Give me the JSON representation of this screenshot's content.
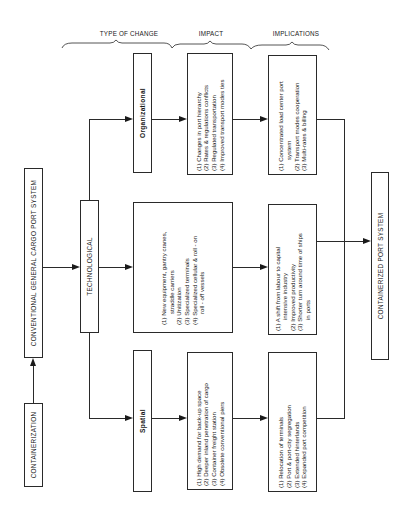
{
  "headers": {
    "type_of_change": "TYPE OF CHANGE",
    "impact": "IMPACT",
    "implications": "IMPLICATIONS"
  },
  "start": {
    "containerization": "CONTAINERIZATION",
    "conventional_system": "CONVENTIONAL   GENERAL   CARGO   PORT   SYSTEM"
  },
  "technological": "TECHNOLOGICAL",
  "end": {
    "containerized_system": "CONTAINERIZED   PORT   SYSTEM"
  },
  "rows": {
    "organizational": {
      "type": "Organizational",
      "impact": [
        {
          "text": "(1) Changes in port hierarchy"
        },
        {
          "text": "(2) Rates & regulations conflicts"
        },
        {
          "text": "(3) Regulated transportation"
        },
        {
          "text": "(4) Improved transport modes ties"
        }
      ],
      "implications": [
        {
          "text": "(1) Concentrated load center port",
          "cont": "system"
        },
        {
          "text": "(2) Transport modes cooperation"
        },
        {
          "text": "(3) Multi-rates & billing"
        }
      ]
    },
    "technological": {
      "impact": [
        {
          "text": "(1) New equipment, gantry cranes,",
          "cont": "straddle carriers"
        },
        {
          "text": "(2) Unitization"
        },
        {
          "text": "(3) Specialized terminals"
        },
        {
          "text": "(4) Specialized cellular & roll - on",
          "cont": "roll - off vessels"
        }
      ],
      "implications": [
        {
          "text": "(1) A shift from labour to capital",
          "cont": "intensive industry"
        },
        {
          "text": "(2) Improved productivity"
        },
        {
          "text": "(3) Shorter turn around time of ships",
          "cont": "in ports"
        }
      ]
    },
    "spatial": {
      "type": "Spatial",
      "impact": [
        {
          "text": "(1) High demand for back-up space"
        },
        {
          "text": "(2) Deeper inland penetration of cargo"
        },
        {
          "text": "(3) Container freight station"
        },
        {
          "text": "(4) Obsolete conventional piers"
        }
      ],
      "implications": [
        {
          "text": "(1) Relocation of terminals"
        },
        {
          "text": "(2) Port & port-city segregation"
        },
        {
          "text": "(3) Extended hinterlands"
        },
        {
          "text": "(4) Expanded port competition"
        }
      ]
    }
  }
}
